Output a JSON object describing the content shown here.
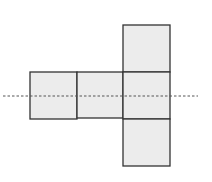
{
  "diagram": {
    "colors": {
      "fill": "#ececec",
      "stroke": "#333333",
      "dash": "#555555"
    },
    "squares": [
      {
        "id": "left",
        "x": 30,
        "y": 72,
        "size": 47
      },
      {
        "id": "middle",
        "x": 77,
        "y": 72,
        "size": 46
      },
      {
        "id": "top",
        "x": 123,
        "y": 25,
        "size": 47
      },
      {
        "id": "center",
        "x": 123,
        "y": 72,
        "size": 47
      },
      {
        "id": "bottom",
        "x": 123,
        "y": 119,
        "size": 47
      }
    ],
    "dashed_line": {
      "x1": 3,
      "y1": 96,
      "x2": 198,
      "y2": 96
    }
  }
}
